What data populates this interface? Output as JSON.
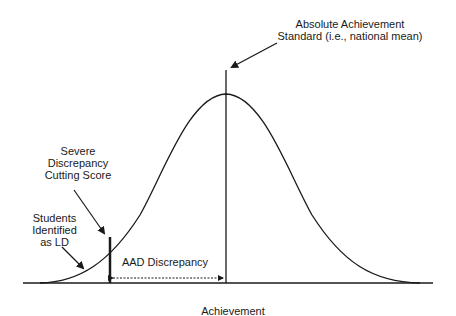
{
  "diagram": {
    "title_label": {
      "line1": "Absolute Achievement",
      "line2": "Standard (i.e., national mean)"
    },
    "cutting_score_label": {
      "line1": "Severe",
      "line2": "Discrepancy",
      "line3": "Cutting Score"
    },
    "students_label": {
      "line1": "Students",
      "line2": "Identified",
      "line3": "as LD"
    },
    "discrepancy_label": "AAD Discrepancy",
    "x_axis_label": "Achievement",
    "colors": {
      "line": "#1a1a1a",
      "background": "#ffffff"
    }
  }
}
